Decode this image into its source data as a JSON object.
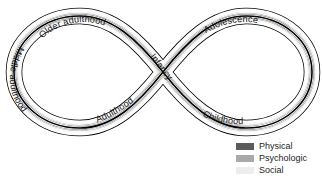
{
  "figure": {
    "type": "lemniscate-lifespan-diagram",
    "title": "",
    "shape": "infinity-symbol",
    "stage_labels": [
      {
        "id": "older-adulthood",
        "text": "Older adulthood",
        "position": "upper-left-arc"
      },
      {
        "id": "middle-adulthood",
        "text": "Middle adulthood",
        "position": "left-arc"
      },
      {
        "id": "adulthood",
        "text": "Adulthood",
        "position": "lower-left-arc"
      },
      {
        "id": "infancy",
        "text": "Infancy",
        "position": "center-crossing"
      },
      {
        "id": "adolescence",
        "text": "Adolescence",
        "position": "upper-right-arc"
      },
      {
        "id": "childhood",
        "text": "Childhood",
        "position": "lower-right-arc"
      }
    ],
    "band_colors": {
      "outline": "#000000",
      "channel": "#ffffff",
      "physical": "#5c5c5c",
      "psychologic": "#a9a9a9",
      "social": "#ededed"
    }
  },
  "legend": {
    "items": [
      {
        "label": "Physical",
        "color": "#5c5c5c"
      },
      {
        "label": "Psychologic",
        "color": "#a9a9a9"
      },
      {
        "label": "Social",
        "color": "#ededed"
      }
    ]
  }
}
